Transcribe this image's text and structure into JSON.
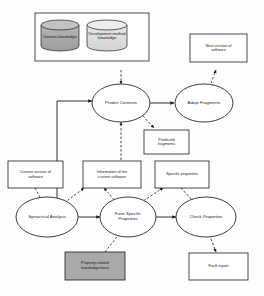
{
  "diagram": {
    "colors": {
      "stroke": "#1c1c1c",
      "background": "#fdfdfd",
      "cylinder_dark": "#a8a8a8",
      "cylinder_light": "#dcdcdc",
      "knowledge_base_fill": "#a9a9a9",
      "box_fill": "#ffffff",
      "ellipse_fill": "#ffffff"
    },
    "knowledge_group": {
      "name": "knowledge-sources-group",
      "cylinders": [
        {
          "id": "domain-knowledge",
          "label": "Domain knowledge",
          "fill": "#a8a8a8"
        },
        {
          "id": "development-method-knowledge",
          "label": "Development method\nknowledge",
          "fill": "#dcdcdc"
        }
      ]
    },
    "processes": [
      {
        "id": "predict-contents",
        "label": "Predict Contents"
      },
      {
        "id": "adapt-fragments",
        "label": "Adapt Fragments"
      },
      {
        "id": "syntactical-analysis",
        "label": "Syntactical Analysis"
      },
      {
        "id": "form-specific-properties",
        "label": "Form Specific\nProperties"
      },
      {
        "id": "check-properties",
        "label": "Check Properties"
      }
    ],
    "artifacts": [
      {
        "id": "next-version-of-software",
        "label": "Next version of\nsoftware"
      },
      {
        "id": "predicted-fragments",
        "label": "Predicted\nfragments"
      },
      {
        "id": "current-version-of-software",
        "label": "Current version of\nsoftware"
      },
      {
        "id": "information-of-current-software",
        "label": "Information of the\ncurrent software"
      },
      {
        "id": "specific-properties",
        "label": "Specific properties"
      },
      {
        "id": "property-related-knowledge-base",
        "label": "Property-related\nknowledge base",
        "shaded": true
      },
      {
        "id": "fault-report",
        "label": "Fault report"
      }
    ],
    "edges": [
      {
        "from": "knowledge-sources-group",
        "to": "predict-contents",
        "style": "dashed"
      },
      {
        "from": "predict-contents",
        "to": "adapt-fragments",
        "style": "solid"
      },
      {
        "from": "adapt-fragments",
        "to": "next-version-of-software",
        "style": "dashed"
      },
      {
        "from": "predict-contents",
        "to": "predicted-fragments",
        "style": "dashed"
      },
      {
        "from": "information-of-current-software",
        "to": "predict-contents",
        "style": "dashed"
      },
      {
        "from": "syntactical-analysis",
        "to": "predict-contents",
        "style": "solid"
      },
      {
        "from": "current-version-of-software",
        "to": "syntactical-analysis",
        "style": "dashed"
      },
      {
        "from": "syntactical-analysis",
        "to": "information-of-current-software",
        "style": "dashed"
      },
      {
        "from": "syntactical-analysis",
        "to": "form-specific-properties",
        "style": "solid"
      },
      {
        "from": "form-specific-properties",
        "to": "information-of-current-software",
        "style": "dashed"
      },
      {
        "from": "form-specific-properties",
        "to": "specific-properties",
        "style": "dashed"
      },
      {
        "from": "property-related-knowledge-base",
        "to": "form-specific-properties",
        "style": "dashed"
      },
      {
        "from": "form-specific-properties",
        "to": "check-properties",
        "style": "solid"
      },
      {
        "from": "specific-properties",
        "to": "check-properties",
        "style": "dashed"
      },
      {
        "from": "check-properties",
        "to": "fault-report",
        "style": "dashed"
      }
    ]
  }
}
